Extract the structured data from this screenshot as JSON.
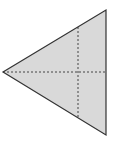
{
  "diagram": {
    "shape": "triangle",
    "vertices": {
      "top": [
        106,
        10
      ],
      "bottom": [
        106,
        135
      ],
      "left": [
        3,
        72
      ]
    },
    "fill": "#d9d9d9",
    "stroke": "#333333",
    "fold_lines": [
      {
        "orientation": "horizontal",
        "from": [
          3,
          72
        ],
        "to": [
          106,
          72
        ]
      },
      {
        "orientation": "vertical",
        "from": [
          78,
          26
        ],
        "to": [
          78,
          119
        ]
      }
    ],
    "fold_line_color": "#333333"
  }
}
